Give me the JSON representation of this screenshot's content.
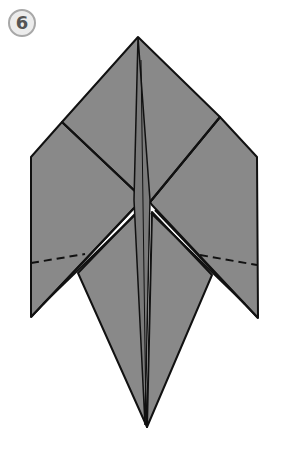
{
  "step": {
    "number": "6"
  },
  "colors": {
    "paper": "#898989",
    "paper_dark": "#7a7a7a",
    "line": "#111111",
    "badge_border": "#a8a8a8",
    "badge_fill": "#ececec"
  },
  "diagram": {
    "lines": {
      "solid": "crease edges",
      "dashed": "fold lines on left and right flaps"
    }
  }
}
